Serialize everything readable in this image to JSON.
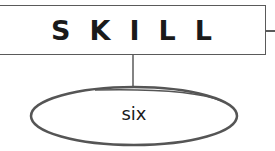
{
  "diagram": {
    "root": {
      "label": "SKILL"
    },
    "child": {
      "label": "six"
    },
    "colors": {
      "stroke": "#5a5a5a",
      "text": "#1a1a1a",
      "background": "#ffffff"
    }
  }
}
